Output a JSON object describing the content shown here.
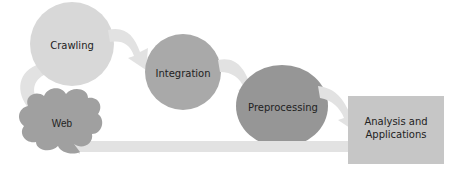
{
  "diagram": {
    "type": "web-data-pipeline-cycle",
    "nodes": [
      {
        "id": "crawling",
        "label": "Crawling",
        "shape": "circle",
        "color": "#d8d8d8"
      },
      {
        "id": "integration",
        "label": "Integration",
        "shape": "circle",
        "color": "#a9a9a9"
      },
      {
        "id": "preprocessing",
        "label": "Preprocessing",
        "shape": "ellipse",
        "color": "#969696"
      },
      {
        "id": "analysis",
        "label_line1": "Analysis and",
        "label_line2": "Applications",
        "shape": "rectangle",
        "color": "#c6c6c6"
      },
      {
        "id": "web",
        "label": "Web",
        "shape": "cloud",
        "color": "#a0a0a0"
      }
    ],
    "edges": [
      {
        "from": "web",
        "to": "crawling"
      },
      {
        "from": "crawling",
        "to": "integration"
      },
      {
        "from": "integration",
        "to": "preprocessing"
      },
      {
        "from": "preprocessing",
        "to": "analysis"
      },
      {
        "from": "analysis",
        "to": "web"
      }
    ],
    "colors": {
      "arrow": "#e2e2e2",
      "background": "#ffffff",
      "text": "#222222"
    }
  }
}
